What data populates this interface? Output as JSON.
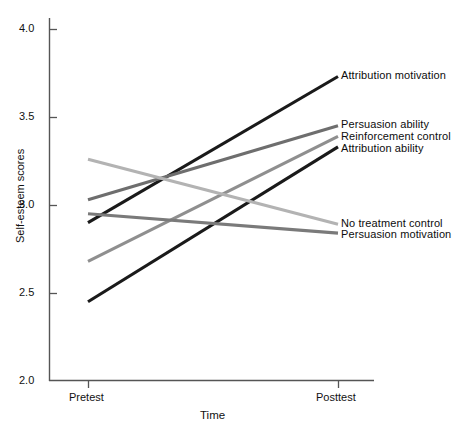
{
  "chart_data": {
    "type": "line",
    "title": "",
    "xlabel": "Time",
    "ylabel": "Self-esteem scores",
    "categories": [
      "Pretest",
      "Posttest"
    ],
    "x": [
      0,
      1
    ],
    "ylim": [
      2.0,
      4.0
    ],
    "yticks": [
      "2.0",
      "2.5",
      "3.0",
      "3.5",
      "4.0"
    ],
    "ytick_values": [
      2.0,
      2.5,
      3.0,
      3.5,
      4.0
    ],
    "grid": false,
    "legend_position": "right-inline-labels",
    "series": [
      {
        "name": "Attribution motivation",
        "values": [
          2.9,
          3.73
        ],
        "color": "#1a1a1a"
      },
      {
        "name": "Persuasion ability",
        "values": [
          3.03,
          3.45
        ],
        "color": "#6e6e6e"
      },
      {
        "name": "Reinforcement control",
        "values": [
          2.68,
          3.39
        ],
        "color": "#8f8f8f"
      },
      {
        "name": "Attribution ability",
        "values": [
          2.45,
          3.33
        ],
        "color": "#1a1a1a"
      },
      {
        "name": "No treatment control",
        "values": [
          3.26,
          2.89
        ],
        "color": "#b3b3b3"
      },
      {
        "name": "Persuasion motivation",
        "values": [
          2.95,
          2.84
        ],
        "color": "#7a7a7a"
      }
    ]
  },
  "axis": {
    "x_title": "Time",
    "y_title": "Self-esteem scores",
    "x_categories": [
      "Pretest",
      "Posttest"
    ],
    "y_ticks": [
      "4.0",
      "3.5",
      "3.0",
      "2.5",
      "2.0"
    ]
  },
  "series_labels": [
    "Attribution motivation",
    "Persuasion ability",
    "Reinforcement control",
    "Attribution ability",
    "No treatment control",
    "Persuasion motivation"
  ],
  "colors": {
    "axis": "#555555",
    "text": "#111111",
    "black_line": "#1a1a1a",
    "dark_gray_line": "#6e6e6e",
    "mid_gray_line": "#8f8f8f",
    "light_gray_line": "#b3b3b3"
  }
}
